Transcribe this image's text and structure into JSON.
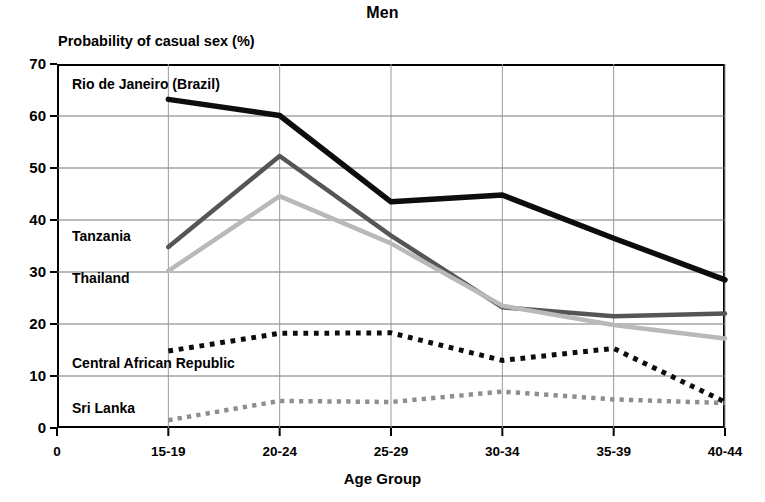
{
  "chart_data": {
    "type": "line",
    "title": "Men",
    "xlabel": "Age Group",
    "ylabel": "Probability of casual sex (%)",
    "categories": [
      "15-19",
      "20-24",
      "25-29",
      "30-34",
      "35-39",
      "40-44"
    ],
    "x_origin_label": "0",
    "xtick_labels": [
      "0",
      "15-19",
      "20-24",
      "25-29",
      "30-34",
      "35-39",
      "40-44"
    ],
    "ytick_labels": [
      "0",
      "10",
      "20",
      "30",
      "40",
      "50",
      "60",
      "70"
    ],
    "ylim": [
      0,
      70
    ],
    "ytick_step": 10,
    "grid": true,
    "legend": "inline-labels",
    "series": [
      {
        "name": "Rio de Janeiro (Brazil)",
        "color": "#0d0d0d",
        "style": "solid",
        "width": 5.5,
        "values": [
          63.2,
          60.1,
          43.5,
          44.8,
          36.5,
          28.5
        ],
        "label_x": 72,
        "label_y": 76
      },
      {
        "name": "Tanzania",
        "color": "#555555",
        "style": "solid",
        "width": 4.5,
        "values": [
          34.8,
          52.3,
          37.0,
          23.2,
          21.5,
          22.0
        ],
        "label_x": 72,
        "label_y": 228
      },
      {
        "name": "Thailand",
        "color": "#b9b9b9",
        "style": "solid",
        "width": 4.5,
        "values": [
          30.2,
          44.6,
          35.5,
          23.5,
          19.8,
          17.2
        ],
        "label_x": 72,
        "label_y": 270
      },
      {
        "name": "Central African Republic",
        "color": "#0d0d0d",
        "style": "dotted",
        "width": 5,
        "values": [
          14.8,
          18.2,
          18.3,
          13.0,
          15.3,
          5.0
        ],
        "label_x": 72,
        "label_y": 355
      },
      {
        "name": "Sri Lanka",
        "color": "#8e8e8e",
        "style": "dotted",
        "width": 4.5,
        "values": [
          1.5,
          5.2,
          5.0,
          7.0,
          5.5,
          4.8
        ],
        "label_x": 72,
        "label_y": 400
      }
    ]
  }
}
